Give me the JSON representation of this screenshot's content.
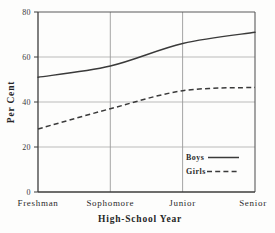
{
  "chart_data": {
    "type": "line",
    "title": "",
    "xlabel": "High-School Year",
    "ylabel": "Per Cent",
    "categories": [
      "Freshman",
      "Sophomore",
      "Junior",
      "Senior"
    ],
    "series": [
      {
        "name": "Boys",
        "style": "solid",
        "values": [
          51,
          56,
          66,
          71
        ],
        "color": "#3a3a3a"
      },
      {
        "name": "Girls",
        "style": "dashed",
        "values": [
          28,
          37,
          45,
          46.5
        ],
        "color": "#3a3a3a"
      }
    ],
    "ylim": [
      0,
      80
    ],
    "yticks": [
      0,
      20,
      40,
      60,
      80
    ],
    "ytick_labels": [
      "0",
      "20",
      "40",
      "60",
      "80"
    ],
    "grid": true,
    "legend_position": "bottom-right"
  },
  "axis": {
    "y_label": "Per Cent",
    "x_label": "High-School Year",
    "y_ticks": [
      "80",
      "60",
      "40",
      "20",
      "0"
    ],
    "x_ticks": [
      "Freshman",
      "Sophomore",
      "Junior",
      "Senior"
    ]
  },
  "legend": {
    "boys_label": "Boys",
    "girls_label": "Girls"
  }
}
